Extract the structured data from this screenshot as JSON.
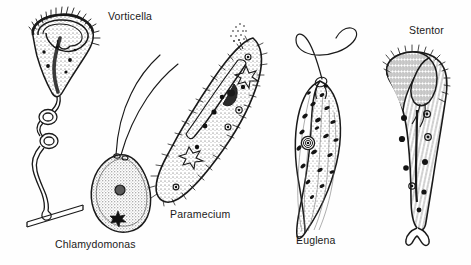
{
  "figure": {
    "style": "black-and-white stippled line drawing",
    "background_color": "#fefefe",
    "ink_color": "#1a1a1a",
    "width": 471,
    "height": 265
  },
  "organisms": [
    {
      "id": "vorticella",
      "label": "Vorticella",
      "label_position": "top-right-of-figure",
      "body_shape": "inverted bell / goblet",
      "features": [
        "ciliary ring at oral rim",
        "contracted coiled stalk",
        "macronucleus band",
        "stippled cytoplasm",
        "attachment to substrate"
      ]
    },
    {
      "id": "chlamydomonas",
      "label": "Chlamydomonas",
      "label_position": "below-figure",
      "body_shape": "ovoid / teardrop",
      "features": [
        "two anterior flagella",
        "central nucleus",
        "star-shaped pyrenoid",
        "stippled chloroplast"
      ]
    },
    {
      "id": "paramecium",
      "label": "Paramecium",
      "label_position": "below-figure",
      "body_shape": "slipper",
      "features": [
        "full ciliary coat",
        "oral groove and gullet",
        "two star-shaped contractile vacuoles",
        "food vacuoles",
        "macronucleus",
        "trichocyst discharge"
      ]
    },
    {
      "id": "euglena",
      "label": "Euglena",
      "label_position": "below-figure",
      "body_shape": "elongated spindle",
      "features": [
        "single long anterior flagellum",
        "eyespot",
        "numerous chloroplasts",
        "ringed nucleus with nucleolus",
        "pellicle striations"
      ]
    },
    {
      "id": "stentor",
      "label": "Stentor",
      "label_position": "top-right",
      "body_shape": "trumpet / cone",
      "features": [
        "wide ciliated oral disc",
        "adoral membranelle band",
        "beaded moniliform macronucleus",
        "longitudinal striations",
        "lobed holdfast base"
      ]
    }
  ],
  "labels": {
    "vorticella": "Vorticella",
    "chlamydomonas": "Chlamydomonas",
    "paramecium": "Paramecium",
    "euglena": "Euglena",
    "stentor": "Stentor"
  }
}
